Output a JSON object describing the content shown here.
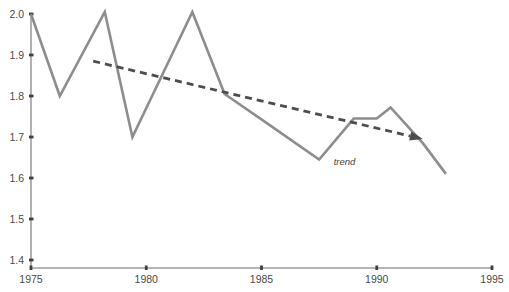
{
  "chart_data": {
    "type": "line",
    "title": "",
    "subtitle": "",
    "xlabel": "",
    "ylabel": "",
    "xlim": [
      1975,
      1995
    ],
    "ylim": [
      1.4,
      2.0
    ],
    "grid": false,
    "legend_position": "none",
    "x_ticks": [
      "1975",
      "1980",
      "1985",
      "1990",
      "1995"
    ],
    "x_tick_values": [
      1975,
      1980,
      1985,
      1990,
      1995
    ],
    "y_ticks": [
      "1.4",
      "1.5",
      "1.6",
      "1.7",
      "1.8",
      "1.9",
      "2.0"
    ],
    "y_tick_values": [
      1.4,
      1.5,
      1.6,
      1.7,
      1.8,
      1.9,
      2.0
    ],
    "series": [
      {
        "name": "data",
        "color": "#8d8d8d",
        "style": "solid",
        "x": [
          1975,
          1976.25,
          1978.2,
          1979.4,
          1982,
          1983.4,
          1985.2,
          1987.5,
          1989,
          1990,
          1990.6,
          1992,
          1993
        ],
        "values": [
          2.0,
          1.8,
          2.005,
          1.7,
          2.005,
          1.805,
          1.735,
          1.645,
          1.745,
          1.745,
          1.772,
          1.685,
          1.61
        ]
      },
      {
        "name": "trend",
        "color": "#4d4d4d",
        "style": "dashed",
        "x": [
          1977.7,
          1992.0
        ],
        "values": [
          1.885,
          1.695
        ]
      }
    ],
    "annotations": [
      {
        "name": "trend",
        "text": "trend",
        "x": 1988.6,
        "y": 1.632
      },
      {
        "name": "trend-arrowhead",
        "text": "",
        "x": 1992.0,
        "y": 1.695
      }
    ]
  },
  "axes": {
    "axis_color": "#9a9a9a",
    "tick_color": "#4a4a4a",
    "background": "#ffffff"
  }
}
